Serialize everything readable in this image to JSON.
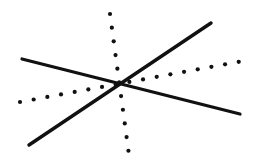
{
  "figure": {
    "type": "line-drawing",
    "width": 255,
    "height": 162,
    "background_color": "#ffffff",
    "stroke_color": "#111111",
    "center": {
      "x": 121,
      "y": 82
    },
    "elements": [
      {
        "name": "solid-line-descending",
        "style": "solid",
        "color": "#111111",
        "width": 3.2,
        "x1": 22,
        "y1": 59,
        "x2": 240,
        "y2": 114
      },
      {
        "name": "solid-line-ascending",
        "style": "solid",
        "color": "#111111",
        "width": 3.4,
        "x1": 29,
        "y1": 145,
        "x2": 211,
        "y2": 23
      },
      {
        "name": "dotted-line-steep",
        "style": "dotted",
        "color": "#111111",
        "dot_radius": 2.1,
        "dot_spacing": 13.8,
        "x1": 110,
        "y1": 14,
        "x2": 129,
        "y2": 155
      },
      {
        "name": "dotted-line-shallow",
        "style": "dotted",
        "color": "#111111",
        "dot_radius": 2.1,
        "dot_spacing": 13.9,
        "x1": 20,
        "y1": 102,
        "x2": 243,
        "y2": 61
      }
    ]
  }
}
